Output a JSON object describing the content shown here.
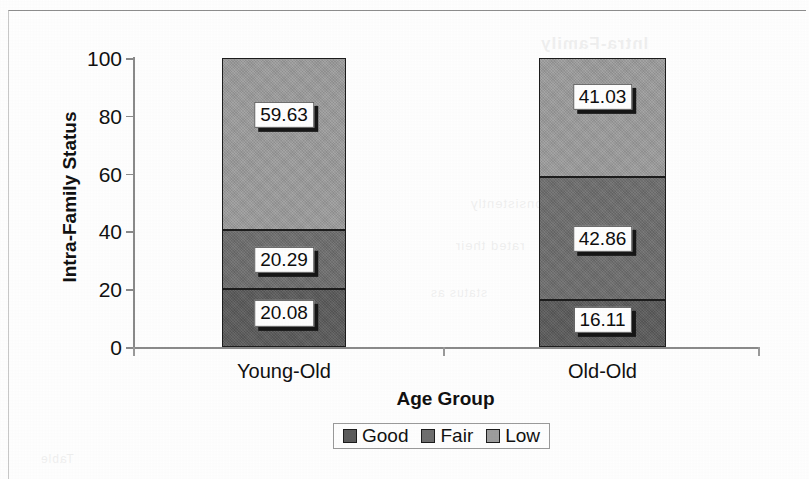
{
  "figure": {
    "background_color": "#ffffff",
    "frame_color": "#8e8e8e"
  },
  "ghost_text": {
    "top": "Intra-Family",
    "mid": "consistently",
    "mid2": "rated their",
    "low": "status as",
    "bottom": "Table"
  },
  "chart_data": {
    "type": "bar",
    "subtype": "stacked-100-percent",
    "title": "",
    "xlabel": "Age Group",
    "ylabel": "Intra-Family Status",
    "categories": [
      "Young-Old",
      "Old-Old"
    ],
    "ylim": [
      0,
      100
    ],
    "yticks": [
      0,
      20,
      40,
      60,
      80,
      100
    ],
    "ytick_labels": [
      "0",
      "20",
      "40",
      "60",
      "80",
      "100"
    ],
    "grid": false,
    "legend_position": "bottom-center",
    "series": [
      {
        "name": "Good",
        "color": "#5b5b5b",
        "values": [
          20.08,
          16.11
        ],
        "labels": [
          "20.08",
          "16.11"
        ]
      },
      {
        "name": "Fair",
        "color": "#6e6e6e",
        "values": [
          20.29,
          42.86
        ],
        "labels": [
          "20.29",
          "42.86"
        ]
      },
      {
        "name": "Low",
        "color": "#9d9d9d",
        "values": [
          59.63,
          41.03
        ],
        "labels": [
          "59.63",
          "41.03"
        ]
      }
    ]
  }
}
